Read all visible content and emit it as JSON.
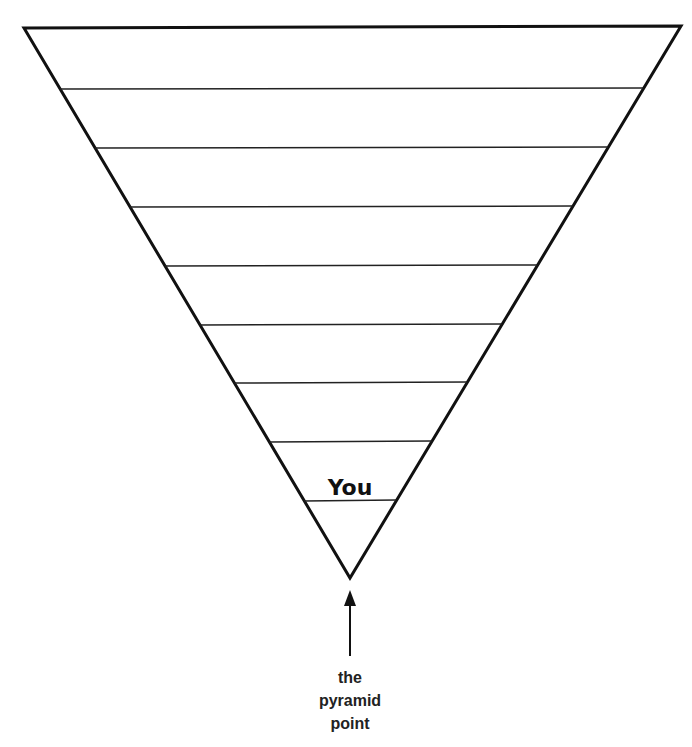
{
  "diagram": {
    "type": "inverted-pyramid",
    "colors": {
      "stroke": "#111111",
      "background": "#ffffff"
    },
    "outline": {
      "top_left": [
        24,
        28
      ],
      "top_right": [
        681,
        26
      ],
      "apex": [
        350,
        578
      ]
    },
    "level_lines_y": [
      89,
      148,
      207,
      266,
      325,
      383,
      442,
      501
    ],
    "levels": [
      {
        "index": 1,
        "label": ""
      },
      {
        "index": 2,
        "label": ""
      },
      {
        "index": 3,
        "label": ""
      },
      {
        "index": 4,
        "label": ""
      },
      {
        "index": 5,
        "label": ""
      },
      {
        "index": 6,
        "label": ""
      },
      {
        "index": 7,
        "label": ""
      },
      {
        "index": 8,
        "label": ""
      },
      {
        "index": 9,
        "label": "You"
      },
      {
        "index": 10,
        "label": ""
      }
    ],
    "you_label": "You",
    "arrow": {
      "icon": "up-arrow-icon"
    },
    "caption": [
      "the",
      "pyramid",
      "point"
    ]
  }
}
